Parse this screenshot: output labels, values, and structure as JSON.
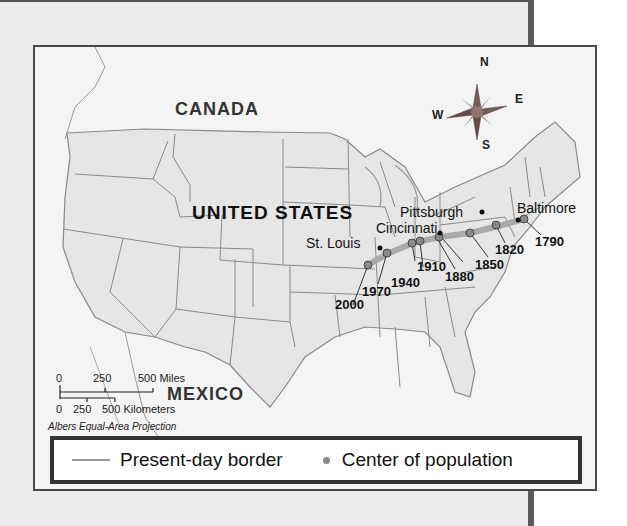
{
  "map": {
    "countries": {
      "canada": "CANADA",
      "united_states": "UNITED STATES",
      "mexico": "MEXICO"
    },
    "cities": [
      {
        "name": "Pittsburgh"
      },
      {
        "name": "Cincinnati"
      },
      {
        "name": "St. Louis"
      },
      {
        "name": "Baltimore"
      }
    ],
    "population_centers": [
      {
        "year": "1790"
      },
      {
        "year": "1820"
      },
      {
        "year": "1850"
      },
      {
        "year": "1880"
      },
      {
        "year": "1910"
      },
      {
        "year": "1940"
      },
      {
        "year": "1970"
      },
      {
        "year": "2000"
      }
    ],
    "compass": {
      "n": "N",
      "e": "E",
      "s": "S",
      "w": "W"
    },
    "scale": {
      "miles_ticks": [
        "0",
        "250",
        "500 Miles"
      ],
      "km_ticks": [
        "0",
        "250",
        "500 Kilometers"
      ]
    },
    "projection": "Albers Equal-Area Projection",
    "colors": {
      "border": "#999999",
      "center_dot": "#888888",
      "trend_band": "#a9a9a9"
    }
  },
  "legend": {
    "border_label": "Present-day border",
    "center_label": "Center of population"
  }
}
